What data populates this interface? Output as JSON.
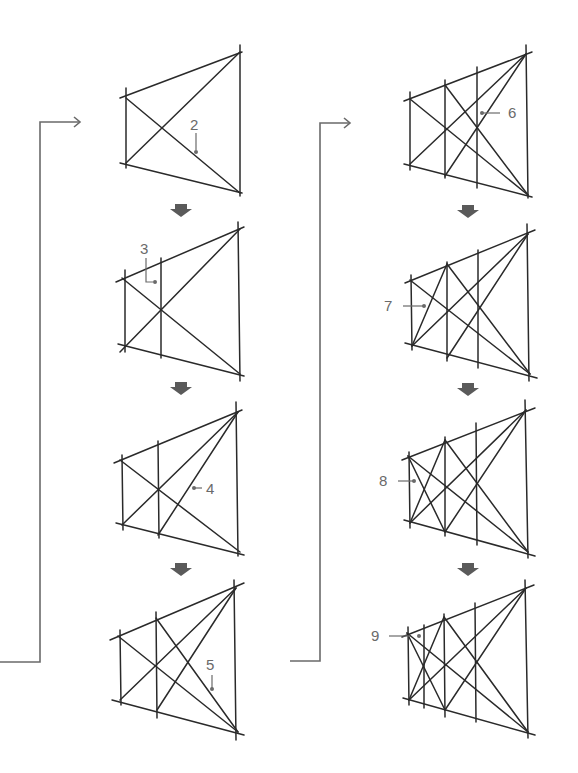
{
  "diagram": {
    "title": "",
    "colors": {
      "line": "#2a2a2a",
      "annotation": "#6a6a6a",
      "arrow": "#5a5a5a",
      "background": "#ffffff"
    },
    "columns": [
      {
        "steps": [
          {
            "label": "2"
          },
          {
            "label": "3"
          },
          {
            "label": "4"
          },
          {
            "label": "5"
          }
        ]
      },
      {
        "steps": [
          {
            "label": "6"
          },
          {
            "label": "7"
          },
          {
            "label": "8"
          },
          {
            "label": "9"
          }
        ]
      }
    ],
    "flow": "Steps proceed top to bottom in each column; continuation arrows connect from the end of one column to the start of the next."
  }
}
